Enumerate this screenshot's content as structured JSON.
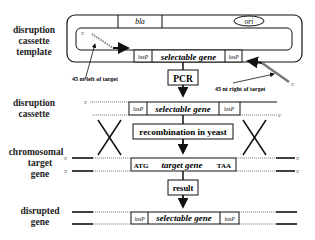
{
  "row_labels": {
    "template": [
      "disruption",
      "cassette",
      "template"
    ],
    "cassette": [
      "disruption",
      "cassette"
    ],
    "chromosomal": [
      "chromosomal",
      "target",
      "gene"
    ],
    "disrupted": [
      "disrupted",
      "gene"
    ]
  },
  "template": {
    "bla": "bla",
    "ori": "ori",
    "loxP_left": "loxP",
    "selectable_gene": "selectable gene",
    "loxP_right": "loxP",
    "primer_left_5": "5'",
    "primer_right_5": "5'",
    "annotation_left": "45 nt left of target",
    "annotation_right": "45 nt right of target"
  },
  "steps": {
    "pcr": "PCR",
    "recombination": "recombination in yeast",
    "result": "result"
  },
  "cassette": {
    "top_5": "5'",
    "bottom_5": "5'",
    "loxP_left": "loxP",
    "selectable_gene": "selectable gene",
    "loxP_right": "loxP"
  },
  "chromosome": {
    "top_left": "5'",
    "top_right": "3'",
    "bottom_left": "3'",
    "bottom_right": "5'",
    "start_codon": "ATG",
    "target_gene": "target gene",
    "stop_codon": "TAA"
  },
  "disrupted": {
    "loxP_left": "loxP",
    "selectable_gene": "selectable gene",
    "loxP_right": "loxP"
  }
}
